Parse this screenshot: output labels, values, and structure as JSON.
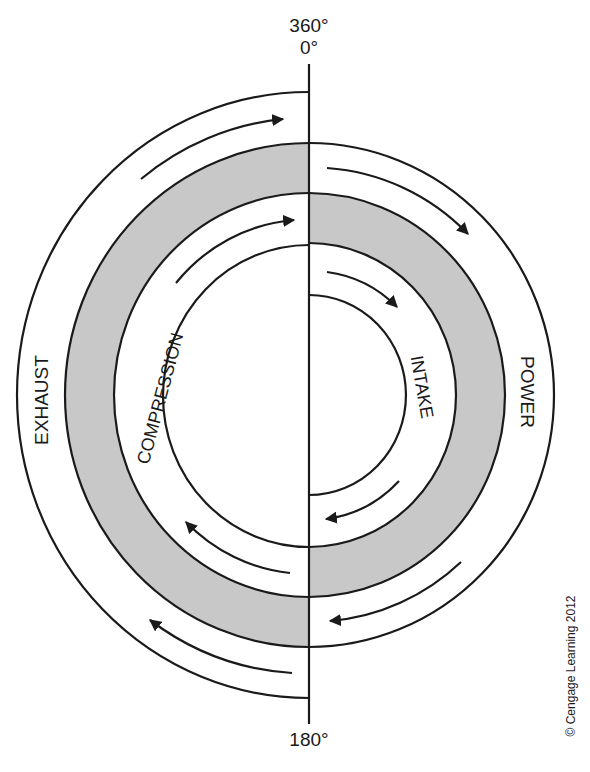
{
  "diagram": {
    "type": "four-stroke-cycle-spiral",
    "colors": {
      "line": "#1a1a1a",
      "shade": "#c8c8c8",
      "background": "#ffffff"
    },
    "degree_labels": {
      "top_line1": "360°",
      "top_line2": "0°",
      "bottom": "180°"
    },
    "strokes": [
      {
        "name": "INTAKE",
        "side": "right",
        "ring": 1
      },
      {
        "name": "COMPRESSION",
        "side": "left",
        "ring": 2
      },
      {
        "name": "POWER",
        "side": "right",
        "ring": 3
      },
      {
        "name": "EXHAUST",
        "side": "left",
        "ring": 4
      }
    ],
    "labels": {
      "intake": "INTAKE",
      "compression": "COMPRESSION",
      "power": "POWER",
      "exhaust": "EXHAUST"
    },
    "copyright": "© Cengage Learning 2012"
  }
}
